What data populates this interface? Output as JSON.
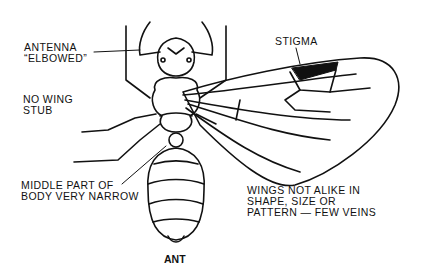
{
  "diagram": {
    "title": "ANT",
    "labels": {
      "antenna": [
        "ANTENNA",
        "“ELBOWED”"
      ],
      "no_wing_stub": [
        "NO WING",
        "STUB"
      ],
      "stigma": "STIGMA",
      "middle_part": [
        "MIDDLE PART OF",
        "BODY VERY NARROW"
      ],
      "wings": [
        "WINGS NOT ALIKE IN",
        "SHAPE, SIZE OR",
        "PATTERN — FEW VEINS"
      ]
    },
    "colors": {
      "ink": "#111111",
      "background": "#ffffff"
    }
  }
}
